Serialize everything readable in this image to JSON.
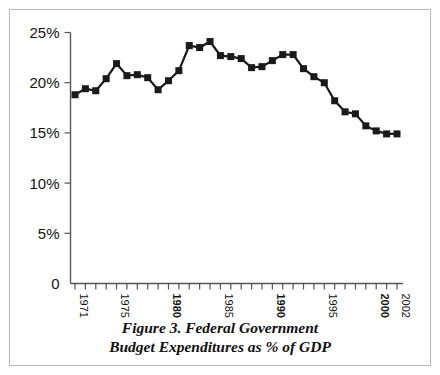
{
  "figure": {
    "caption_line1": "Figure 3. Federal Government",
    "caption_line2": "Budget Expenditures as % of GDP",
    "border_color": "#b9b9b9",
    "background_color": "#ffffff"
  },
  "chart_data": {
    "type": "line",
    "title": "Figure 3. Federal Government Budget Expenditures as % of GDP",
    "xlabel": "",
    "ylabel": "",
    "ylim": [
      0,
      25
    ],
    "xlim": [
      1971,
      2002
    ],
    "grid": false,
    "legend": "none",
    "marker": "square",
    "marker_color": "#1a1a1a",
    "line_color": "#1a1a1a",
    "y_ticks": [
      0,
      5,
      10,
      15,
      20,
      25
    ],
    "y_tick_labels": [
      "0",
      "5%",
      "10%",
      "15%",
      "20%",
      "25%"
    ],
    "x_tick_labels": [
      {
        "year": 1971,
        "label": "1971",
        "bold": false
      },
      {
        "year": 1975,
        "label": "1975",
        "bold": false
      },
      {
        "year": 1980,
        "label": "1980",
        "bold": true
      },
      {
        "year": 1985,
        "label": "1985",
        "bold": false
      },
      {
        "year": 1990,
        "label": "1990",
        "bold": true
      },
      {
        "year": 1995,
        "label": "1995",
        "bold": false
      },
      {
        "year": 2000,
        "label": "2000",
        "bold": true
      },
      {
        "year": 2002,
        "label": "2002",
        "bold": false
      }
    ],
    "x": [
      1971,
      1972,
      1973,
      1974,
      1975,
      1976,
      1977,
      1978,
      1979,
      1980,
      1981,
      1982,
      1983,
      1984,
      1985,
      1986,
      1987,
      1988,
      1989,
      1990,
      1991,
      1992,
      1993,
      1994,
      1995,
      1996,
      1997,
      1998,
      1999,
      2000,
      2001,
      2002
    ],
    "values": [
      18.8,
      19.4,
      19.2,
      20.4,
      21.9,
      20.7,
      20.8,
      20.5,
      19.3,
      20.2,
      21.2,
      23.7,
      23.5,
      24.1,
      22.7,
      22.6,
      22.4,
      21.5,
      21.6,
      22.2,
      22.8,
      22.8,
      21.4,
      20.6,
      20.0,
      18.2,
      17.1,
      16.9,
      15.7,
      15.2,
      14.9,
      14.9
    ],
    "unit": "%"
  }
}
